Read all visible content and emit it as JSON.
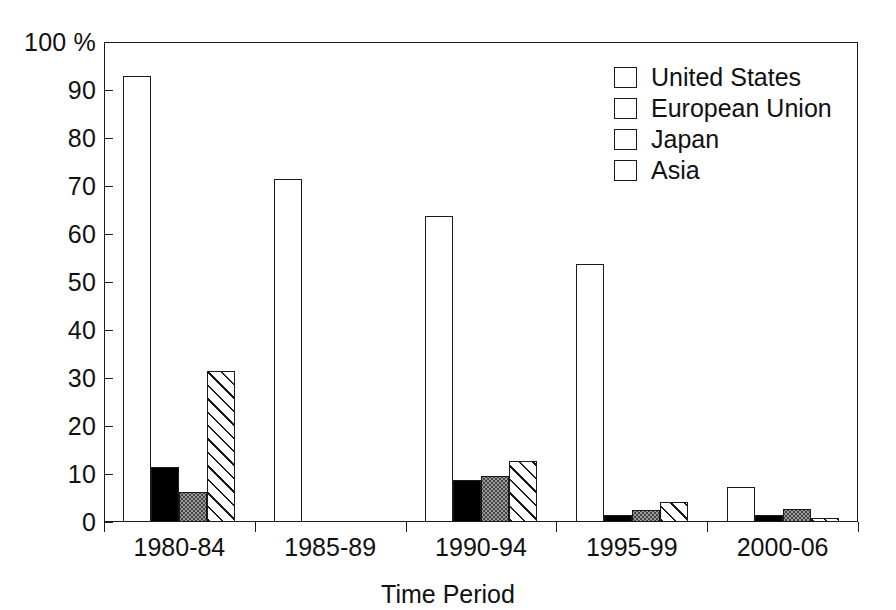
{
  "chart_data": {
    "type": "bar",
    "title": "",
    "xlabel": "Time Period",
    "ylabel": "100 %",
    "ylim": [
      0,
      100
    ],
    "ytick_values": [
      0,
      10,
      20,
      30,
      40,
      50,
      60,
      70,
      80,
      90,
      100
    ],
    "ytick_labels": [
      "0",
      "10",
      "20",
      "30",
      "40",
      "50",
      "60",
      "70",
      "80",
      "90",
      "100 %"
    ],
    "grid": false,
    "legend_position": "top-right",
    "categories": [
      "1980-84",
      "1985-89",
      "1990-94",
      "1995-99",
      "2000-06"
    ],
    "series": [
      {
        "name": "United States",
        "key": "us",
        "fill": "white",
        "color": "#ffffff",
        "values": [
          93.0,
          71.5,
          63.8,
          53.8,
          7.3
        ]
      },
      {
        "name": "European Union",
        "key": "eu",
        "fill": "solid-black",
        "color": "#000000",
        "values": [
          11.5,
          0,
          8.7,
          1.5,
          1.5
        ]
      },
      {
        "name": "Japan",
        "key": "jp",
        "fill": "gray-stipple",
        "color": "#9b9b9b",
        "values": [
          6.3,
          0,
          9.5,
          2.5,
          2.8
        ]
      },
      {
        "name": "Asia",
        "key": "as",
        "fill": "diagonal-hatch",
        "color": "#ffffff",
        "values": [
          31.5,
          0,
          12.7,
          4.2,
          0.8
        ]
      }
    ]
  },
  "legend": {
    "items": [
      {
        "label": "United States",
        "series": "us"
      },
      {
        "label": "European Union",
        "series": "eu"
      },
      {
        "label": "Japan",
        "series": "jp"
      },
      {
        "label": "Asia",
        "series": "as"
      }
    ]
  },
  "axes": {
    "x_title": "Time Period"
  },
  "colors": {
    "axis": "#1a1a1a",
    "text": "#111111",
    "background": "#ffffff"
  }
}
